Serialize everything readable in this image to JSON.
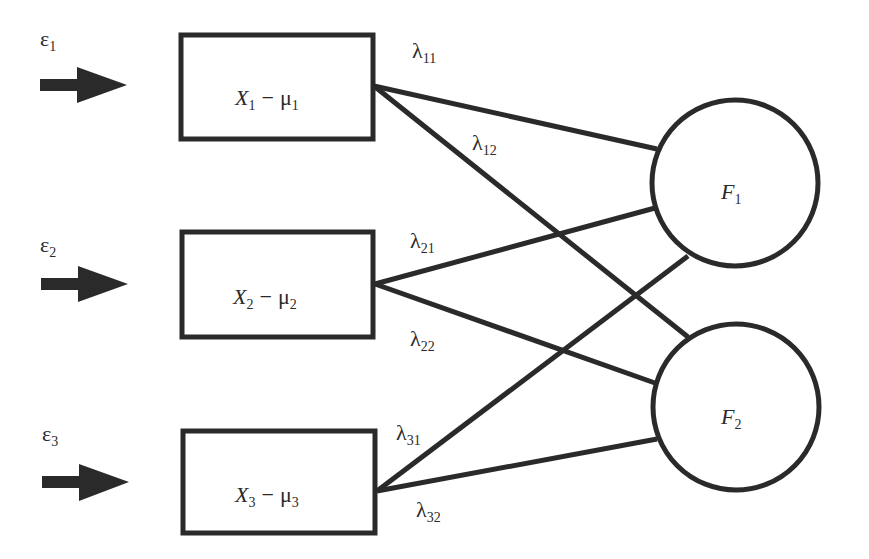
{
  "diagram": {
    "type": "factor-analysis-path-diagram",
    "colors": {
      "stroke": "#2a2a2a",
      "background": "#ffffff",
      "arrow": "#2a2a2a"
    },
    "errors": [
      {
        "symbol": "ε",
        "sub": "1"
      },
      {
        "symbol": "ε",
        "sub": "2"
      },
      {
        "symbol": "ε",
        "sub": "3"
      }
    ],
    "observed": [
      {
        "var": "X",
        "var_sub": "1",
        "op": "−",
        "mean": "μ",
        "mean_sub": "1"
      },
      {
        "var": "X",
        "var_sub": "2",
        "op": "−",
        "mean": "μ",
        "mean_sub": "2"
      },
      {
        "var": "X",
        "var_sub": "3",
        "op": "−",
        "mean": "μ",
        "mean_sub": "3"
      }
    ],
    "factors": [
      {
        "var": "F",
        "sub": "1"
      },
      {
        "var": "F",
        "sub": "2"
      }
    ],
    "loadings": [
      {
        "symbol": "λ",
        "sub": "11",
        "from": "X1",
        "to": "F1"
      },
      {
        "symbol": "λ",
        "sub": "12",
        "from": "X1",
        "to": "F2"
      },
      {
        "symbol": "λ",
        "sub": "21",
        "from": "X2",
        "to": "F1"
      },
      {
        "symbol": "λ",
        "sub": "22",
        "from": "X2",
        "to": "F2"
      },
      {
        "symbol": "λ",
        "sub": "31",
        "from": "X3",
        "to": "F1"
      },
      {
        "symbol": "λ",
        "sub": "32",
        "from": "X3",
        "to": "F2"
      }
    ]
  }
}
